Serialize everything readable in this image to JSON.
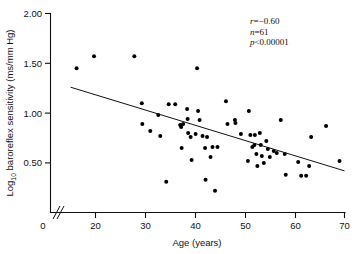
{
  "chart_data": {
    "type": "scatter",
    "title": "",
    "xlabel": "Age (years)",
    "ylabel": "Log10 baroreflex sensitivity (ms/mm Hg)",
    "ylabel_prefix": "Log",
    "ylabel_subscript": "10",
    "ylabel_rest": " baroreflex sensitivity (ms/mm Hg)",
    "xlim": [
      12,
      70
    ],
    "ylim": [
      0.0,
      2.0
    ],
    "xticks": [
      0,
      20,
      30,
      40,
      50,
      60,
      70
    ],
    "xtick_labels": [
      "0",
      "20",
      "30",
      "40",
      "50",
      "60",
      "70"
    ],
    "yticks": [
      0.5,
      1.0,
      1.5,
      2.0
    ],
    "ytick_labels": [
      "0.50",
      "1.00",
      "1.50",
      "2.00"
    ],
    "grid": false,
    "legend": "none",
    "axis_break": true,
    "marker": "filled-circle",
    "marker_color": "#000000",
    "points": [
      [
        16.2,
        1.45
      ],
      [
        19.7,
        1.57
      ],
      [
        27.8,
        1.57
      ],
      [
        29.3,
        1.1
      ],
      [
        29.4,
        0.89
      ],
      [
        31.0,
        0.82
      ],
      [
        32.6,
        0.98
      ],
      [
        33.0,
        0.77
      ],
      [
        34.2,
        0.31
      ],
      [
        34.7,
        1.09
      ],
      [
        36.0,
        1.09
      ],
      [
        37.0,
        0.88
      ],
      [
        37.2,
        0.86
      ],
      [
        37.3,
        0.65
      ],
      [
        37.6,
        0.89
      ],
      [
        38.4,
        1.04
      ],
      [
        38.5,
        0.94
      ],
      [
        38.6,
        0.8
      ],
      [
        39.1,
        0.76
      ],
      [
        39.3,
        0.53
      ],
      [
        40.1,
        0.79
      ],
      [
        40.4,
        1.45
      ],
      [
        40.6,
        1.02
      ],
      [
        40.9,
        0.93
      ],
      [
        41.5,
        0.77
      ],
      [
        42.0,
        0.65
      ],
      [
        42.1,
        0.33
      ],
      [
        42.4,
        0.76
      ],
      [
        43.1,
        0.56
      ],
      [
        43.5,
        0.66
      ],
      [
        44.0,
        0.22
      ],
      [
        44.5,
        0.66
      ],
      [
        46.2,
        1.12
      ],
      [
        46.5,
        0.89
      ],
      [
        48.0,
        0.93
      ],
      [
        48.1,
        0.9
      ],
      [
        49.2,
        0.79
      ],
      [
        50.6,
        0.52
      ],
      [
        50.8,
        1.02
      ],
      [
        51.1,
        0.78
      ],
      [
        51.5,
        0.66
      ],
      [
        51.9,
        0.68
      ],
      [
        52.0,
        0.78
      ],
      [
        52.3,
        0.59
      ],
      [
        52.5,
        0.47
      ],
      [
        53.0,
        0.8
      ],
      [
        53.2,
        0.68
      ],
      [
        53.4,
        0.57
      ],
      [
        53.8,
        0.5
      ],
      [
        54.3,
        0.72
      ],
      [
        54.6,
        0.64
      ],
      [
        55.0,
        0.56
      ],
      [
        55.8,
        0.62
      ],
      [
        56.4,
        0.6
      ],
      [
        57.2,
        0.93
      ],
      [
        58.0,
        0.59
      ],
      [
        58.2,
        0.38
      ],
      [
        60.7,
        0.51
      ],
      [
        61.3,
        0.37
      ],
      [
        62.3,
        0.37
      ],
      [
        62.9,
        0.47
      ],
      [
        63.3,
        0.76
      ],
      [
        66.3,
        0.87
      ],
      [
        69.0,
        0.52
      ]
    ],
    "trendline": {
      "x_start": 15.0,
      "y_start": 1.26,
      "x_end": 70.0,
      "y_end": 0.42
    },
    "annotations": {
      "r_label": "r",
      "r_value": "=−0.60",
      "n_label": "n",
      "n_value": "=61",
      "p_label": "p",
      "p_value": "<0.00001"
    }
  }
}
